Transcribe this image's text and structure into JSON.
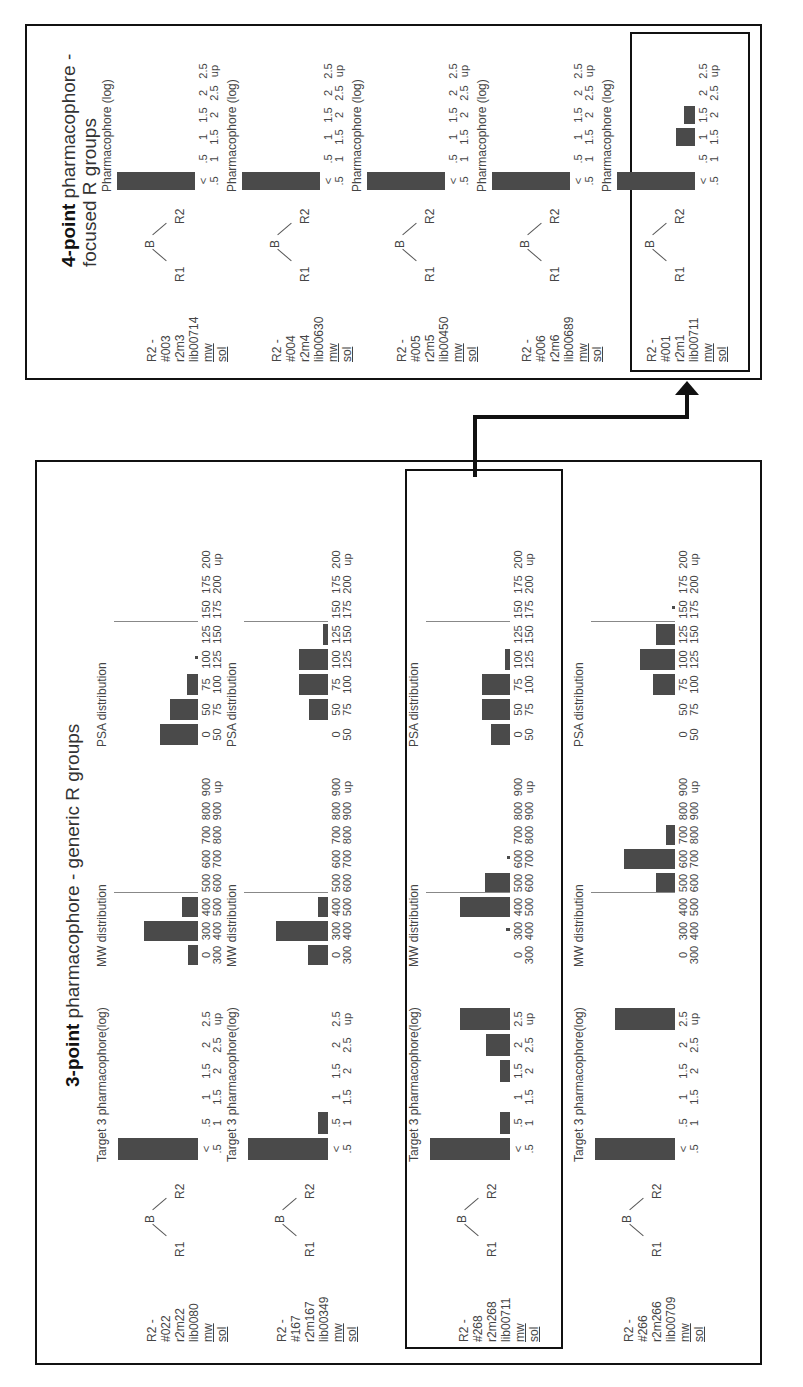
{
  "panels": {
    "three_point": {
      "title_bold": "3-point",
      "title_rest": " pharmacophore - generic R groups"
    },
    "four_point": {
      "title_bold": "4-point",
      "title_rest": " pharmacophore -",
      "title_line2": "focused R groups"
    }
  },
  "molecule": {
    "r1": "R1",
    "b": "B",
    "r2": "R2"
  },
  "chart_titles": {
    "target3": "Target 3 pharmacophore(log)",
    "mw": "MW distribution",
    "psa": "PSA distribution",
    "pharm4": "Pharmacophore (log)"
  },
  "bins": {
    "pharm": [
      [
        "<",
        ".5"
      ],
      [
        ".5",
        "1"
      ],
      [
        "1",
        "1.5"
      ],
      [
        "1.5",
        "2"
      ],
      [
        "2",
        "2.5"
      ],
      [
        "2.5",
        "up"
      ]
    ],
    "mw": [
      [
        "0",
        "300"
      ],
      [
        "300",
        "400"
      ],
      [
        "400",
        "500"
      ],
      [
        "500",
        "600"
      ],
      [
        "600",
        "700"
      ],
      [
        "700",
        "800"
      ],
      [
        "800",
        "900"
      ],
      [
        "900",
        "up"
      ]
    ],
    "psa": [
      [
        "0",
        "50"
      ],
      [
        "50",
        "75"
      ],
      [
        "75",
        "100"
      ],
      [
        "100",
        "125"
      ],
      [
        "125",
        "150"
      ],
      [
        "150",
        "175"
      ],
      [
        "175",
        "200"
      ],
      [
        "200",
        "up"
      ]
    ]
  },
  "three_point_rows": [
    {
      "id": "R2 - #022",
      "code": "r2m22",
      "lib": "lib0080",
      "mw": "mw",
      "sol": "sol",
      "highlighted": false
    },
    {
      "id": "R2 - #167",
      "code": "r2m167",
      "lib": "lib00349",
      "mw": "mw",
      "sol": "sol",
      "highlighted": false
    },
    {
      "id": "R2 - #268",
      "code": "r2m268",
      "lib": "lib00711",
      "mw": "mw",
      "sol": "sol",
      "highlighted": true
    },
    {
      "id": "R2 - #266",
      "code": "r2m266",
      "lib": "lib00709",
      "mw": "mw",
      "sol": "sol",
      "highlighted": false
    }
  ],
  "four_point_rows": [
    {
      "id": "R2 - #003",
      "code": "r2m3",
      "lib": "lib00714",
      "mw": "mw",
      "sol": "sol",
      "highlighted": false
    },
    {
      "id": "R2 - #004",
      "code": "r2m4",
      "lib": "lib00630",
      "mw": "mw",
      "sol": "sol",
      "highlighted": false
    },
    {
      "id": "R2 - #005",
      "code": "r2m5",
      "lib": "lib00450",
      "mw": "mw",
      "sol": "sol",
      "highlighted": false
    },
    {
      "id": "R2 - #006",
      "code": "r2m6",
      "lib": "lib00689",
      "mw": "mw",
      "sol": "sol",
      "highlighted": false
    },
    {
      "id": "R2 - #001",
      "code": "r2m1",
      "lib": "lib00711",
      "mw": "mw",
      "sol": "sol",
      "highlighted": true
    }
  ],
  "chart_data": [
    {
      "type": "bar",
      "title": "Target 3 pharmacophore(log)",
      "panel": "3-point pharmacophore - generic R groups",
      "categories": [
        "<.5",
        ".5-1",
        "1-1.5",
        "1.5-2",
        "2-2.5",
        "2.5-up"
      ],
      "series": [
        {
          "name": "R2 - #022",
          "values": [
            100,
            0,
            0,
            0,
            0,
            0
          ]
        },
        {
          "name": "R2 - #167",
          "values": [
            100,
            13,
            0,
            0,
            0,
            0
          ]
        },
        {
          "name": "R2 - #268",
          "values": [
            100,
            13,
            0,
            13,
            30,
            63
          ]
        },
        {
          "name": "R2 - #266",
          "values": [
            100,
            0,
            0,
            0,
            0,
            75
          ]
        }
      ],
      "ylim": [
        0,
        100
      ]
    },
    {
      "type": "bar",
      "title": "MW distribution",
      "panel": "3-point pharmacophore - generic R groups",
      "categories": [
        "0-300",
        "300-400",
        "400-500",
        "500-600",
        "600-700",
        "700-800",
        "800-900",
        "900-up"
      ],
      "series": [
        {
          "name": "R2 - #022",
          "values": [
            12,
            68,
            20,
            0,
            0,
            0,
            0,
            0
          ]
        },
        {
          "name": "R2 - #167",
          "values": [
            25,
            65,
            12,
            0,
            0,
            0,
            0,
            0
          ]
        },
        {
          "name": "R2 - #268",
          "values": [
            0,
            5,
            63,
            31,
            2,
            0,
            0,
            0
          ]
        },
        {
          "name": "R2 - #266",
          "values": [
            0,
            0,
            0,
            24,
            64,
            11,
            0,
            0
          ]
        }
      ],
      "ylim": [
        0,
        100
      ]
    },
    {
      "type": "bar",
      "title": "PSA distribution",
      "panel": "3-point pharmacophore - generic R groups",
      "categories": [
        "0-50",
        "50-75",
        "75-100",
        "100-125",
        "125-150",
        "150-175",
        "175-200",
        "200-up"
      ],
      "series": [
        {
          "name": "R2 - #022",
          "values": [
            47,
            35,
            14,
            4,
            0,
            0,
            0,
            0
          ]
        },
        {
          "name": "R2 - #167",
          "values": [
            0,
            24,
            36,
            36,
            6,
            0,
            0,
            0
          ]
        },
        {
          "name": "R2 - #268",
          "values": [
            24,
            35,
            35,
            6,
            0,
            0,
            0,
            0
          ]
        },
        {
          "name": "R2 - #266",
          "values": [
            0,
            0,
            27,
            44,
            24,
            4,
            0,
            0
          ]
        }
      ],
      "ylim": [
        0,
        100
      ]
    },
    {
      "type": "bar",
      "title": "Pharmacophore (log)",
      "panel": "4-point pharmacophore - focused R groups",
      "categories": [
        "<.5",
        ".5-1",
        "1-1.5",
        "1.5-2",
        "2-2.5",
        "2.5-up"
      ],
      "series": [
        {
          "name": "R2 - #003",
          "values": [
            100,
            0,
            0,
            0,
            0,
            0
          ]
        },
        {
          "name": "R2 - #004",
          "values": [
            100,
            0,
            0,
            0,
            0,
            0
          ]
        },
        {
          "name": "R2 - #005",
          "values": [
            100,
            0,
            0,
            0,
            0,
            0
          ]
        },
        {
          "name": "R2 - #006",
          "values": [
            100,
            0,
            0,
            0,
            0,
            0
          ]
        },
        {
          "name": "R2 - #001",
          "values": [
            100,
            0,
            24,
            14,
            0,
            0
          ]
        }
      ],
      "ylim": [
        0,
        100
      ]
    }
  ]
}
